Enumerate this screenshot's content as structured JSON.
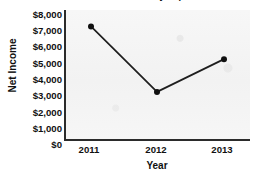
{
  "chart_data": {
    "type": "line",
    "title": "Net Income as Historically Reported",
    "xlabel": "Year",
    "ylabel": "Net Income",
    "categories": [
      "2011",
      "2012",
      "2013"
    ],
    "values": [
      7000,
      3000,
      5000
    ],
    "series": [
      {
        "name": "Net Income",
        "values": [
          7000,
          3000,
          5000
        ]
      }
    ],
    "ylim": [
      0,
      8000
    ],
    "ytick_values": [
      8000,
      7000,
      6000,
      5000,
      4000,
      3000,
      2000,
      1000,
      0
    ],
    "ytick_labels": [
      "$8,000",
      "$7,000",
      "$6,000",
      "$5,000",
      "$4,000",
      "$3,000",
      "$2,000",
      "$1,000",
      "$0"
    ],
    "xtick_labels": [
      "2011",
      "2012",
      "2013"
    ],
    "grid": false,
    "legend": "none",
    "line_color": "#1e1e1e",
    "marker_color": "#101010",
    "marker_shape": "circle",
    "plot_background": "#f4f4f4",
    "axis_color": "#2b2b2b"
  }
}
